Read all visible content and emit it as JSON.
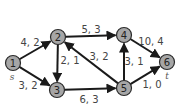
{
  "graph": {
    "nodes": [
      {
        "id": "1",
        "label": "1",
        "x": 13,
        "y": 63
      },
      {
        "id": "2",
        "label": "2",
        "x": 58,
        "y": 37
      },
      {
        "id": "3",
        "label": "3",
        "x": 57,
        "y": 90
      },
      {
        "id": "4",
        "label": "4",
        "x": 124,
        "y": 35
      },
      {
        "id": "5",
        "label": "5",
        "x": 124,
        "y": 88
      },
      {
        "id": "6",
        "label": "6",
        "x": 167,
        "y": 62
      }
    ],
    "edges": [
      {
        "from": "1",
        "to": "2",
        "label": "4, 2",
        "lx": 30,
        "ly": 42
      },
      {
        "from": "1",
        "to": "3",
        "label": "3, 2",
        "lx": 28,
        "ly": 85
      },
      {
        "from": "2",
        "to": "3",
        "label": "2, 1",
        "lx": 70,
        "ly": 60
      },
      {
        "from": "2",
        "to": "4",
        "label": "5, 3",
        "lx": 91,
        "ly": 29
      },
      {
        "from": "5",
        "to": "2",
        "label": "3, 2",
        "lx": 99,
        "ly": 56
      },
      {
        "from": "3",
        "to": "5",
        "label": "6, 3",
        "lx": 89,
        "ly": 99
      },
      {
        "from": "5",
        "to": "4",
        "label": "3, 1",
        "lx": 134,
        "ly": 61
      },
      {
        "from": "4",
        "to": "6",
        "label": "10, 4",
        "lx": 151,
        "ly": 41
      },
      {
        "from": "5",
        "to": "6",
        "label": "1, 0",
        "lx": 152,
        "ly": 84
      }
    ],
    "source_label": "s",
    "sink_label": "t"
  }
}
